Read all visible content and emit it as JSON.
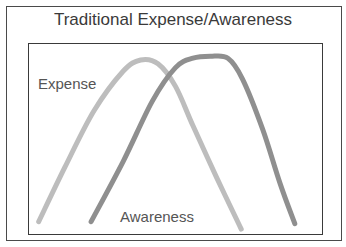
{
  "chart_data": {
    "type": "line",
    "title": "Traditional Expense/Awareness",
    "xlabel": "",
    "ylabel": "",
    "grid": false,
    "axes_visible": false,
    "x_range": [
      0,
      100
    ],
    "y_range": [
      0,
      100
    ],
    "series": [
      {
        "name": "Expense",
        "color": "#bdbdbd",
        "x": [
          3,
          12,
          22,
          32,
          38,
          44,
          50,
          56,
          64,
          72,
          72
        ],
        "y": [
          6,
          35,
          65,
          86,
          92,
          90,
          78,
          57,
          30,
          4,
          4
        ]
      },
      {
        "name": "Awareness",
        "color": "#8f8f8f",
        "x": [
          21,
          32,
          42,
          50,
          56,
          62,
          68,
          73,
          80,
          86,
          91
        ],
        "y": [
          6,
          38,
          70,
          88,
          93,
          94,
          93,
          82,
          55,
          26,
          5
        ]
      }
    ],
    "annotations": [
      {
        "text": "Expense",
        "near_series": "Expense",
        "position": "upper-left"
      },
      {
        "text": "Awareness",
        "near_series": "Awareness",
        "position": "bottom-center"
      }
    ]
  }
}
